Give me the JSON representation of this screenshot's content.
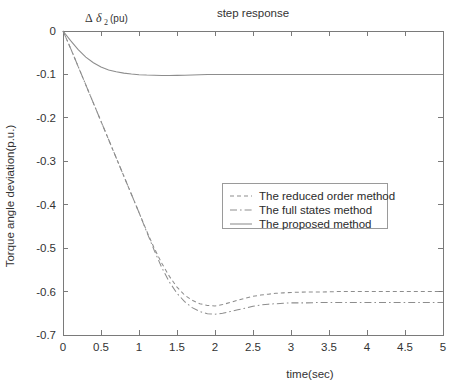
{
  "chart_data": {
    "type": "line",
    "title": "step response",
    "xlabel": "time(sec)",
    "ylabel": "Torque angle deviation(p.u.)",
    "annotation": {
      "delta": "Δ",
      "symbol": "δ",
      "subscript": "2",
      "unit": "(pu)",
      "full": "Δ δ₂ (pu)"
    },
    "xlim": [
      0,
      5
    ],
    "ylim": [
      -0.7,
      0
    ],
    "grid": false,
    "legend_position": "center-right",
    "xticks": [
      0,
      0.5,
      1,
      1.5,
      2,
      2.5,
      3,
      3.5,
      4,
      4.5,
      5
    ],
    "xticklabels": [
      "0",
      "0.5",
      "1",
      "1.5",
      "2",
      "2.5",
      "3",
      "3.5",
      "4",
      "4.5",
      "5"
    ],
    "yticks": [
      0,
      -0.1,
      -0.2,
      -0.3,
      -0.4,
      -0.5,
      -0.6,
      -0.7
    ],
    "yticklabels": [
      "0",
      "-0.1",
      "-0.2",
      "-0.3",
      "-0.4",
      "-0.5",
      "-0.6",
      "-0.7"
    ],
    "x": [
      0,
      0.1,
      0.2,
      0.3,
      0.4,
      0.5,
      0.6,
      0.7,
      0.8,
      0.9,
      1.0,
      1.1,
      1.2,
      1.3,
      1.4,
      1.5,
      1.6,
      1.7,
      1.8,
      1.9,
      2.0,
      2.1,
      2.2,
      2.3,
      2.4,
      2.5,
      2.6,
      2.7,
      2.8,
      2.9,
      3.0,
      3.2,
      3.4,
      3.6,
      3.8,
      4.0,
      4.2,
      4.4,
      4.6,
      4.8,
      5.0
    ],
    "series": [
      {
        "name": "The reduced order method",
        "style": "dashed",
        "color": "#8d8d8d",
        "values": [
          0,
          -0.04,
          -0.082,
          -0.124,
          -0.166,
          -0.208,
          -0.25,
          -0.292,
          -0.334,
          -0.376,
          -0.418,
          -0.46,
          -0.5,
          -0.535,
          -0.565,
          -0.59,
          -0.608,
          -0.62,
          -0.628,
          -0.632,
          -0.633,
          -0.63,
          -0.625,
          -0.62,
          -0.615,
          -0.611,
          -0.608,
          -0.606,
          -0.604,
          -0.603,
          -0.602,
          -0.601,
          -0.601,
          -0.6,
          -0.6,
          -0.6,
          -0.6,
          -0.6,
          -0.6,
          -0.6,
          -0.6
        ]
      },
      {
        "name": "The full states method",
        "style": "dash-dot",
        "color": "#8d8d8d",
        "values": [
          0,
          -0.04,
          -0.082,
          -0.124,
          -0.166,
          -0.208,
          -0.25,
          -0.292,
          -0.334,
          -0.376,
          -0.418,
          -0.462,
          -0.505,
          -0.545,
          -0.578,
          -0.604,
          -0.623,
          -0.637,
          -0.646,
          -0.651,
          -0.652,
          -0.65,
          -0.646,
          -0.642,
          -0.638,
          -0.634,
          -0.631,
          -0.629,
          -0.628,
          -0.627,
          -0.626,
          -0.626,
          -0.625,
          -0.625,
          -0.625,
          -0.625,
          -0.625,
          -0.625,
          -0.625,
          -0.625,
          -0.625
        ]
      },
      {
        "name": "The proposed method",
        "style": "solid",
        "color": "#8d8d8d",
        "values": [
          0,
          -0.022,
          -0.043,
          -0.06,
          -0.073,
          -0.083,
          -0.09,
          -0.094,
          -0.097,
          -0.099,
          -0.1005,
          -0.1015,
          -0.102,
          -0.1025,
          -0.1025,
          -0.1022,
          -0.1018,
          -0.1012,
          -0.1008,
          -0.1004,
          -0.1002,
          -0.1001,
          -0.1,
          -0.1,
          -0.1,
          -0.1,
          -0.1,
          -0.1,
          -0.1,
          -0.1,
          -0.1,
          -0.1,
          -0.1,
          -0.1,
          -0.1,
          -0.1,
          -0.1,
          -0.1,
          -0.1,
          -0.1,
          -0.1
        ]
      }
    ]
  },
  "legend": {
    "items": [
      {
        "label": "The reduced order method",
        "style": "dashed"
      },
      {
        "label": "The full states method",
        "style": "dash-dot"
      },
      {
        "label": "The proposed method",
        "style": "solid"
      }
    ]
  }
}
